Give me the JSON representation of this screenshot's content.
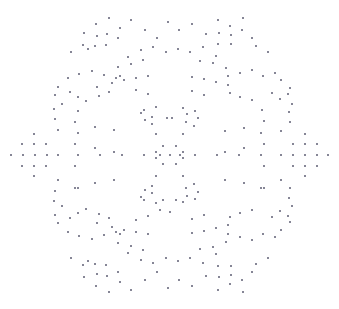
{
  "figure": {
    "width": 339,
    "height": 309,
    "background_color": "#ffffff",
    "title": "",
    "xlabel": "",
    "ylabel": "",
    "axes_visible": false,
    "grid_visible": false,
    "legend_visible": false
  },
  "marker": {
    "color": "#808090",
    "shape": "square",
    "size_px": 2.4,
    "opacity": 0.95
  },
  "chart_data": {
    "type": "scatter",
    "title": "",
    "subtitle": "",
    "xlabel": "",
    "ylabel": "",
    "grid": false,
    "legend": null,
    "xlim": [
      0,
      339
    ],
    "ylim": [
      0,
      309
    ],
    "y_axis_inverted": true,
    "point_count": 260,
    "series": [
      {
        "name": "points",
        "color": "#808090",
        "points": [
          [
            96,
            24
          ],
          [
            109,
            18
          ],
          [
            120,
            28
          ],
          [
            131,
            20
          ],
          [
            84,
            33
          ],
          [
            97,
            36
          ],
          [
            107,
            34
          ],
          [
            118,
            38
          ],
          [
            83,
            45
          ],
          [
            95,
            46
          ],
          [
            106,
            45
          ],
          [
            145,
            30
          ],
          [
            157,
            38
          ],
          [
            168,
            22
          ],
          [
            179,
            30
          ],
          [
            192,
            24
          ],
          [
            218,
            20
          ],
          [
            230,
            26
          ],
          [
            243,
            18
          ],
          [
            206,
            34
          ],
          [
            219,
            33
          ],
          [
            231,
            35
          ],
          [
            242,
            30
          ],
          [
            252,
            38
          ],
          [
            218,
            44
          ],
          [
            231,
            44
          ],
          [
            141,
            50
          ],
          [
            153,
            47
          ],
          [
            166,
            52
          ],
          [
            178,
            49
          ],
          [
            190,
            52
          ],
          [
            203,
            47
          ],
          [
            128,
            57
          ],
          [
            216,
            56
          ],
          [
            71,
            52
          ],
          [
            88,
            49
          ],
          [
            256,
            46
          ],
          [
            268,
            52
          ],
          [
            131,
            64
          ],
          [
            143,
            60
          ],
          [
            200,
            61
          ],
          [
            213,
            63
          ],
          [
            118,
            67
          ],
          [
            120,
            76
          ],
          [
            226,
            68
          ],
          [
            228,
            76
          ],
          [
            79,
            74
          ],
          [
            92,
            71
          ],
          [
            104,
            75
          ],
          [
            116,
            78
          ],
          [
            240,
            73
          ],
          [
            252,
            70
          ],
          [
            263,
            76
          ],
          [
            275,
            73
          ],
          [
            68,
            78
          ],
          [
            58,
            87
          ],
          [
            281,
            80
          ],
          [
            290,
            88
          ],
          [
            97,
            87
          ],
          [
            112,
            83
          ],
          [
            124,
            80
          ],
          [
            136,
            78
          ],
          [
            148,
            76
          ],
          [
            192,
            77
          ],
          [
            204,
            79
          ],
          [
            216,
            82
          ],
          [
            228,
            85
          ],
          [
            55,
            95
          ],
          [
            62,
            104
          ],
          [
            70,
            92
          ],
          [
            78,
            97
          ],
          [
            272,
            93
          ],
          [
            280,
            99
          ],
          [
            288,
            94
          ],
          [
            292,
            104
          ],
          [
            99,
            96
          ],
          [
            109,
            92
          ],
          [
            136,
            90
          ],
          [
            148,
            94
          ],
          [
            192,
            91
          ],
          [
            204,
            95
          ],
          [
            230,
            93
          ],
          [
            240,
            97
          ],
          [
            86,
            101
          ],
          [
            252,
            100
          ],
          [
            54,
            109
          ],
          [
            55,
            119
          ],
          [
            289,
            112
          ],
          [
            290,
            122
          ],
          [
            78,
            111
          ],
          [
            262,
            110
          ],
          [
            144,
            110
          ],
          [
            156,
            107
          ],
          [
            183,
            108
          ],
          [
            195,
            111
          ],
          [
            75,
            122
          ],
          [
            264,
            121
          ],
          [
            141,
            113
          ],
          [
            152,
            117
          ],
          [
            187,
            114
          ],
          [
            198,
            118
          ],
          [
            145,
            120
          ],
          [
            152,
            124
          ],
          [
            186,
            122
          ],
          [
            194,
            126
          ],
          [
            58,
            130
          ],
          [
            281,
            131
          ],
          [
            78,
            133
          ],
          [
            261,
            133
          ],
          [
            95,
            127
          ],
          [
            244,
            128
          ],
          [
            114,
            130
          ],
          [
            225,
            131
          ],
          [
            156,
            134
          ],
          [
            183,
            134
          ],
          [
            34,
            134
          ],
          [
            305,
            134
          ],
          [
            22,
            144
          ],
          [
            34,
            144
          ],
          [
            46,
            144
          ],
          [
            293,
            144
          ],
          [
            305,
            144
          ],
          [
            317,
            144
          ],
          [
            11,
            155
          ],
          [
            23,
            155
          ],
          [
            35,
            155
          ],
          [
            47,
            155
          ],
          [
            58,
            155
          ],
          [
            281,
            155
          ],
          [
            293,
            155
          ],
          [
            305,
            155
          ],
          [
            317,
            155
          ],
          [
            328,
            155
          ],
          [
            22,
            166
          ],
          [
            34,
            166
          ],
          [
            46,
            166
          ],
          [
            293,
            166
          ],
          [
            305,
            166
          ],
          [
            317,
            166
          ],
          [
            34,
            176
          ],
          [
            305,
            176
          ],
          [
            78,
            155
          ],
          [
            100,
            155
          ],
          [
            122,
            155
          ],
          [
            144,
            155
          ],
          [
            195,
            155
          ],
          [
            217,
            155
          ],
          [
            239,
            155
          ],
          [
            261,
            155
          ],
          [
            75,
            144
          ],
          [
            264,
            144
          ],
          [
            75,
            166
          ],
          [
            264,
            166
          ],
          [
            95,
            148
          ],
          [
            244,
            148
          ],
          [
            114,
            152
          ],
          [
            225,
            152
          ],
          [
            163,
            146
          ],
          [
            176,
            146
          ],
          [
            160,
            155
          ],
          [
            170,
            155
          ],
          [
            180,
            155
          ],
          [
            163,
            164
          ],
          [
            176,
            164
          ],
          [
            156,
            152
          ],
          [
            183,
            152
          ],
          [
            156,
            158
          ],
          [
            183,
            158
          ],
          [
            58,
            180
          ],
          [
            281,
            180
          ],
          [
            78,
            188
          ],
          [
            261,
            188
          ],
          [
            95,
            183
          ],
          [
            244,
            183
          ],
          [
            114,
            180
          ],
          [
            225,
            180
          ],
          [
            156,
            176
          ],
          [
            183,
            176
          ],
          [
            54,
            201
          ],
          [
            55,
            191
          ],
          [
            289,
            198
          ],
          [
            290,
            188
          ],
          [
            75,
            188
          ],
          [
            264,
            188
          ],
          [
            144,
            200
          ],
          [
            156,
            203
          ],
          [
            183,
            202
          ],
          [
            195,
            199
          ],
          [
            141,
            197
          ],
          [
            152,
            193
          ],
          [
            187,
            196
          ],
          [
            198,
            192
          ],
          [
            145,
            190
          ],
          [
            152,
            186
          ],
          [
            186,
            188
          ],
          [
            194,
            184
          ],
          [
            55,
            215
          ],
          [
            62,
            206
          ],
          [
            70,
            218
          ],
          [
            78,
            213
          ],
          [
            272,
            217
          ],
          [
            280,
            211
          ],
          [
            288,
            216
          ],
          [
            292,
            206
          ],
          [
            99,
            214
          ],
          [
            109,
            218
          ],
          [
            136,
            220
          ],
          [
            148,
            216
          ],
          [
            192,
            219
          ],
          [
            204,
            215
          ],
          [
            230,
            217
          ],
          [
            240,
            213
          ],
          [
            86,
            209
          ],
          [
            252,
            210
          ],
          [
            68,
            232
          ],
          [
            58,
            223
          ],
          [
            281,
            230
          ],
          [
            290,
            222
          ],
          [
            97,
            223
          ],
          [
            112,
            227
          ],
          [
            124,
            230
          ],
          [
            136,
            232
          ],
          [
            148,
            234
          ],
          [
            192,
            233
          ],
          [
            204,
            231
          ],
          [
            216,
            228
          ],
          [
            228,
            225
          ],
          [
            79,
            236
          ],
          [
            92,
            239
          ],
          [
            104,
            235
          ],
          [
            116,
            232
          ],
          [
            240,
            237
          ],
          [
            252,
            240
          ],
          [
            263,
            234
          ],
          [
            275,
            237
          ],
          [
            118,
            243
          ],
          [
            120,
            234
          ],
          [
            226,
            242
          ],
          [
            228,
            234
          ],
          [
            131,
            246
          ],
          [
            143,
            250
          ],
          [
            200,
            249
          ],
          [
            213,
            247
          ],
          [
            128,
            253
          ],
          [
            216,
            254
          ],
          [
            71,
            258
          ],
          [
            88,
            261
          ],
          [
            256,
            264
          ],
          [
            268,
            258
          ],
          [
            141,
            260
          ],
          [
            153,
            263
          ],
          [
            166,
            258
          ],
          [
            178,
            261
          ],
          [
            190,
            258
          ],
          [
            203,
            263
          ],
          [
            96,
            286
          ],
          [
            109,
            292
          ],
          [
            120,
            282
          ],
          [
            131,
            290
          ],
          [
            84,
            277
          ],
          [
            97,
            274
          ],
          [
            107,
            276
          ],
          [
            118,
            272
          ],
          [
            83,
            265
          ],
          [
            95,
            264
          ],
          [
            106,
            265
          ],
          [
            145,
            280
          ],
          [
            157,
            272
          ],
          [
            168,
            288
          ],
          [
            179,
            280
          ],
          [
            192,
            286
          ],
          [
            218,
            290
          ],
          [
            230,
            284
          ],
          [
            243,
            292
          ],
          [
            206,
            276
          ],
          [
            219,
            277
          ],
          [
            231,
            275
          ],
          [
            242,
            280
          ],
          [
            252,
            272
          ],
          [
            218,
            266
          ],
          [
            231,
            266
          ],
          [
            163,
            200
          ],
          [
            176,
            200
          ],
          [
            160,
            210
          ],
          [
            170,
            212
          ],
          [
            167,
            118
          ],
          [
            172,
            118
          ]
        ]
      }
    ]
  }
}
